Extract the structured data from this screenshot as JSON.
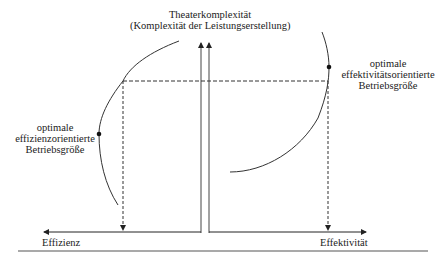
{
  "title": {
    "line1": "Theaterkomplexität",
    "line2": "(Komplexität der Leistungserstellung)"
  },
  "left_label": {
    "line1": "optimale",
    "line2": "effizienzorientierte",
    "line3": "Betriebsgröße"
  },
  "right_label": {
    "line1": "optimale",
    "line2": "effektivitätsorientierte",
    "line3": "Betriebsgröße"
  },
  "axes": {
    "left_x_label": "Effizienz",
    "right_x_label": "Effektivität"
  },
  "colors": {
    "line": "#333333",
    "dash": "#333333",
    "rule": "#555555"
  }
}
